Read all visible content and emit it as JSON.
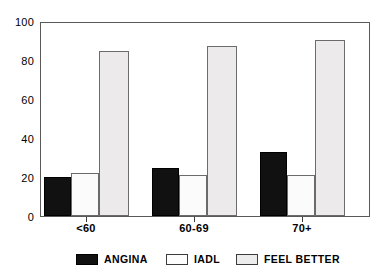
{
  "chart_data": {
    "type": "bar",
    "title": "",
    "xlabel": "",
    "ylabel": "",
    "categories": [
      "<60",
      "60-69",
      "70+"
    ],
    "series": [
      {
        "name": "ANGINA",
        "color": "#111111",
        "values": [
          20,
          25,
          33
        ]
      },
      {
        "name": "IADL",
        "color": "#fbfbfb",
        "values": [
          22.5,
          21.5,
          21.5
        ]
      },
      {
        "name": "FEEL BETTER",
        "color": "#eceaea",
        "values": [
          85.5,
          88,
          91
        ]
      }
    ],
    "ylim": [
      0,
      100
    ],
    "yticks": [
      0,
      20,
      40,
      60,
      80,
      100
    ],
    "ytick_labels": [
      "0",
      "20",
      "40",
      "60",
      "80",
      "100"
    ],
    "grid": false,
    "legend_position": "bottom"
  },
  "legend": {
    "items": [
      {
        "label": "ANGINA",
        "swatch": "angina"
      },
      {
        "label": "IADL",
        "swatch": "iadl"
      },
      {
        "label": "FEEL BETTER",
        "swatch": "feelbetter"
      }
    ]
  },
  "axes": {
    "y_labels": [
      "100",
      "80",
      "60",
      "40",
      "20",
      "0"
    ],
    "x_labels": [
      "<60",
      "60-69",
      "70+"
    ]
  }
}
